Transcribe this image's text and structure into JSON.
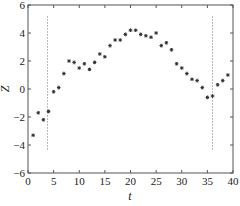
{
  "chart_data": {
    "type": "scatter",
    "title": "",
    "xlabel": "t",
    "ylabel": "Z",
    "xlim": [
      0,
      40
    ],
    "ylim": [
      -6,
      6
    ],
    "xticks": [
      0,
      5,
      10,
      15,
      20,
      25,
      30,
      35,
      40
    ],
    "yticks": [
      -6,
      -4,
      -2,
      0,
      2,
      4,
      6
    ],
    "grid": false,
    "legend": null,
    "series": [
      {
        "name": "Z",
        "marker": "*",
        "color": "#333333",
        "x": [
          1,
          2,
          3,
          4,
          5,
          6,
          7,
          8,
          9,
          10,
          11,
          12,
          13,
          14,
          15,
          16,
          17,
          18,
          19,
          20,
          21,
          22,
          23,
          24,
          25,
          26,
          27,
          28,
          29,
          30,
          31,
          32,
          33,
          34,
          35,
          36,
          37,
          38,
          39
        ],
        "y": [
          -3.3,
          -1.7,
          -2.2,
          -1.6,
          -0.2,
          0.1,
          1.1,
          2.0,
          1.9,
          1.5,
          1.8,
          1.4,
          1.9,
          2.5,
          2.3,
          3.1,
          3.5,
          3.5,
          3.9,
          4.2,
          4.2,
          3.9,
          3.8,
          3.7,
          4.0,
          3.1,
          3.3,
          2.8,
          1.8,
          1.5,
          1.1,
          0.7,
          0.6,
          0.1,
          -0.6,
          -0.5,
          0.3,
          0.6,
          1.0
        ]
      }
    ],
    "annotations": [
      {
        "type": "vline",
        "style": "dashed",
        "x": 3.8,
        "y_from": -4.4,
        "y_to": 5.2
      },
      {
        "type": "vline",
        "style": "dashed",
        "x": 36.0,
        "y_from": -4.4,
        "y_to": 5.2
      }
    ]
  }
}
